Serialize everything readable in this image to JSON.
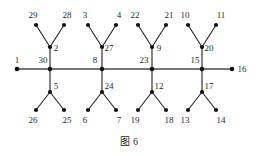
{
  "figure": {
    "caption": "图 6",
    "caption_label": "图",
    "caption_number": "6"
  },
  "chart_data": {
    "type": "diagram",
    "diagram_kind": "tree-graph",
    "title": "图 6",
    "node_count": 30,
    "edge_count": 29,
    "nodes": [
      {
        "id": "1",
        "label": "1",
        "x": 17,
        "y": 69,
        "label_x": 17,
        "label_y": 63,
        "role": "spine-end"
      },
      {
        "id": "30",
        "label": "30",
        "x": 50,
        "y": 69,
        "label_x": 43,
        "label_y": 63,
        "role": "spine-hub"
      },
      {
        "id": "8",
        "label": "8",
        "x": 102,
        "y": 69,
        "label_x": 95,
        "label_y": 63,
        "role": "spine-hub"
      },
      {
        "id": "23",
        "label": "23",
        "x": 152,
        "y": 69,
        "label_x": 144,
        "label_y": 63,
        "role": "spine-hub"
      },
      {
        "id": "15",
        "label": "15",
        "x": 202,
        "y": 69,
        "label_x": 195,
        "label_y": 63,
        "role": "spine-hub"
      },
      {
        "id": "16",
        "label": "16",
        "x": 232,
        "y": 69,
        "label_x": 242,
        "label_y": 72,
        "role": "spine-end"
      },
      {
        "id": "2",
        "label": "2",
        "x": 50,
        "y": 47,
        "label_x": 56,
        "label_y": 51,
        "role": "upper-branch"
      },
      {
        "id": "29",
        "label": "29",
        "x": 36,
        "y": 25,
        "label_x": 33,
        "label_y": 18,
        "role": "leaf"
      },
      {
        "id": "28",
        "label": "28",
        "x": 64,
        "y": 25,
        "label_x": 67,
        "label_y": 18,
        "role": "leaf"
      },
      {
        "id": "5",
        "label": "5",
        "x": 50,
        "y": 92,
        "label_x": 56,
        "label_y": 89,
        "role": "lower-branch"
      },
      {
        "id": "26",
        "label": "26",
        "x": 36,
        "y": 110,
        "label_x": 33,
        "label_y": 123,
        "role": "leaf"
      },
      {
        "id": "25",
        "label": "25",
        "x": 64,
        "y": 110,
        "label_x": 67,
        "label_y": 123,
        "role": "leaf"
      },
      {
        "id": "27",
        "label": "27",
        "x": 102,
        "y": 47,
        "label_x": 109,
        "label_y": 51,
        "role": "upper-branch"
      },
      {
        "id": "3",
        "label": "3",
        "x": 88,
        "y": 25,
        "label_x": 85,
        "label_y": 18,
        "role": "leaf"
      },
      {
        "id": "4",
        "label": "4",
        "x": 116,
        "y": 25,
        "label_x": 119,
        "label_y": 18,
        "role": "leaf"
      },
      {
        "id": "24",
        "label": "24",
        "x": 102,
        "y": 92,
        "label_x": 109,
        "label_y": 89,
        "role": "lower-branch"
      },
      {
        "id": "6",
        "label": "6",
        "x": 88,
        "y": 110,
        "label_x": 85,
        "label_y": 123,
        "role": "leaf"
      },
      {
        "id": "7",
        "label": "7",
        "x": 116,
        "y": 110,
        "label_x": 119,
        "label_y": 123,
        "role": "leaf"
      },
      {
        "id": "9",
        "label": "9",
        "x": 152,
        "y": 47,
        "label_x": 159,
        "label_y": 51,
        "role": "upper-branch"
      },
      {
        "id": "22",
        "label": "22",
        "x": 138,
        "y": 25,
        "label_x": 135,
        "label_y": 18,
        "role": "leaf"
      },
      {
        "id": "21",
        "label": "21",
        "x": 166,
        "y": 25,
        "label_x": 169,
        "label_y": 18,
        "role": "leaf"
      },
      {
        "id": "12",
        "label": "12",
        "x": 152,
        "y": 92,
        "label_x": 159,
        "label_y": 89,
        "role": "lower-branch"
      },
      {
        "id": "19",
        "label": "19",
        "x": 138,
        "y": 110,
        "label_x": 135,
        "label_y": 123,
        "role": "leaf"
      },
      {
        "id": "18",
        "label": "18",
        "x": 166,
        "y": 110,
        "label_x": 169,
        "label_y": 123,
        "role": "leaf"
      },
      {
        "id": "20",
        "label": "20",
        "x": 202,
        "y": 47,
        "label_x": 209,
        "label_y": 51,
        "role": "upper-branch"
      },
      {
        "id": "10",
        "label": "10",
        "x": 188,
        "y": 25,
        "label_x": 185,
        "label_y": 18,
        "role": "leaf"
      },
      {
        "id": "11",
        "label": "11",
        "x": 216,
        "y": 25,
        "label_x": 221,
        "label_y": 18,
        "role": "leaf"
      },
      {
        "id": "17",
        "label": "17",
        "x": 202,
        "y": 92,
        "label_x": 209,
        "label_y": 89,
        "role": "lower-branch"
      },
      {
        "id": "13",
        "label": "13",
        "x": 188,
        "y": 110,
        "label_x": 185,
        "label_y": 123,
        "role": "leaf"
      },
      {
        "id": "14",
        "label": "14",
        "x": 216,
        "y": 110,
        "label_x": 221,
        "label_y": 123,
        "role": "leaf"
      }
    ],
    "spine_edges": [
      {
        "from": "1",
        "to": "30"
      },
      {
        "from": "30",
        "to": "8"
      },
      {
        "from": "8",
        "to": "23"
      },
      {
        "from": "23",
        "to": "15"
      },
      {
        "from": "15",
        "to": "16"
      }
    ],
    "branch_edges": [
      {
        "from": "30",
        "to": "2"
      },
      {
        "from": "2",
        "to": "29"
      },
      {
        "from": "2",
        "to": "28"
      },
      {
        "from": "30",
        "to": "5"
      },
      {
        "from": "5",
        "to": "26"
      },
      {
        "from": "5",
        "to": "25"
      },
      {
        "from": "8",
        "to": "27"
      },
      {
        "from": "27",
        "to": "3"
      },
      {
        "from": "27",
        "to": "4"
      },
      {
        "from": "8",
        "to": "24"
      },
      {
        "from": "24",
        "to": "6"
      },
      {
        "from": "24",
        "to": "7"
      },
      {
        "from": "23",
        "to": "9"
      },
      {
        "from": "9",
        "to": "22"
      },
      {
        "from": "9",
        "to": "21"
      },
      {
        "from": "23",
        "to": "12"
      },
      {
        "from": "12",
        "to": "19"
      },
      {
        "from": "12",
        "to": "18"
      },
      {
        "from": "15",
        "to": "20"
      },
      {
        "from": "20",
        "to": "10"
      },
      {
        "from": "20",
        "to": "11"
      },
      {
        "from": "15",
        "to": "17"
      },
      {
        "from": "17",
        "to": "13"
      },
      {
        "from": "17",
        "to": "14"
      }
    ],
    "colors": {
      "edge": "#2b2b2b",
      "spine": "#4a4a4a",
      "node": "#111111",
      "label": "#1f1f1f",
      "background": "#ffffff"
    }
  }
}
